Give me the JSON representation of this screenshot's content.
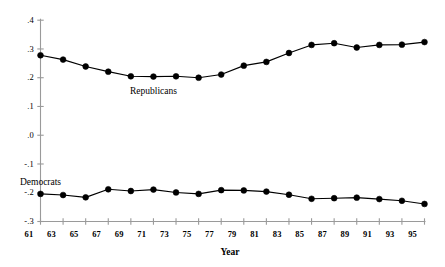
{
  "chart_data": {
    "type": "line",
    "title": "",
    "subtitle": "",
    "xlabel": "Year",
    "ylabel": "",
    "x": [
      61,
      63,
      65,
      67,
      69,
      71,
      73,
      75,
      77,
      79,
      81,
      83,
      85,
      87,
      89,
      91,
      93,
      95
    ],
    "xtick_labels": [
      "61",
      "63",
      "65",
      "67",
      "69",
      "71",
      "73",
      "75",
      "77",
      "79",
      "81",
      "83",
      "85",
      "87",
      "89",
      "91",
      "93",
      "95"
    ],
    "ytick_labels": [
      ".4",
      ".3",
      ".2",
      ".1",
      ".0",
      "-.1",
      "-.2",
      "-.3"
    ],
    "ytick_values": [
      0.4,
      0.3,
      0.2,
      0.1,
      0.0,
      -0.1,
      -0.2,
      -0.3
    ],
    "xlim": [
      61,
      95
    ],
    "ylim": [
      -0.3,
      0.4
    ],
    "grid": false,
    "legend": "inline-annotations",
    "marker": "filled-circle",
    "marker_color": "#000000",
    "line_color": "#000000",
    "series": [
      {
        "name": "Republicans",
        "label_x": 71,
        "label_y": 0.155,
        "values": [
          0.278,
          0.263,
          0.239,
          0.221,
          0.205,
          0.204,
          0.205,
          0.2,
          0.211,
          0.242,
          0.255,
          0.286,
          0.314,
          0.32,
          0.305,
          0.314,
          0.315,
          0.324
        ]
      },
      {
        "name": "Democrats",
        "label_x": 88,
        "label_y": -0.163,
        "values": [
          -0.204,
          -0.208,
          -0.216,
          -0.188,
          -0.194,
          -0.189,
          -0.199,
          -0.204,
          -0.191,
          -0.192,
          -0.196,
          -0.207,
          -0.221,
          -0.219,
          -0.217,
          -0.222,
          -0.228,
          -0.239
        ]
      }
    ]
  }
}
